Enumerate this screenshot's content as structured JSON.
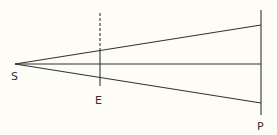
{
  "diagram": {
    "labels": {
      "source": "S",
      "screen": "E",
      "plane": "P"
    },
    "colors": {
      "line": "#333333",
      "background": "#fdfcf7"
    }
  }
}
